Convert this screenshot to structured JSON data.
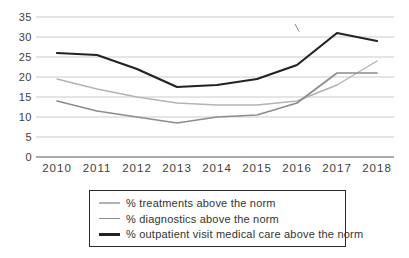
{
  "chart_data": {
    "type": "line",
    "title": "",
    "xlabel": "",
    "ylabel": "",
    "categories": [
      "2010",
      "2011",
      "2012",
      "2013",
      "2014",
      "2015",
      "2016",
      "2017",
      "2018"
    ],
    "y_ticks": [
      35,
      30,
      25,
      20,
      15,
      10,
      5,
      0
    ],
    "ylim": [
      0,
      35
    ],
    "grid": true,
    "legend_position": "bottom-box",
    "series": [
      {
        "id": "treatments",
        "name": "% treatments above the norm",
        "color": "#b3b3b3",
        "stroke_width": 1.4,
        "values": [
          19.5,
          17,
          15,
          13.5,
          13,
          13,
          14,
          18,
          24
        ]
      },
      {
        "id": "diagnostics",
        "name": "% diagnostics above the norm",
        "color": "#8c8c8c",
        "stroke_width": 1.7,
        "values": [
          14,
          11.5,
          10,
          8.5,
          10,
          10.5,
          13.5,
          21,
          21
        ]
      },
      {
        "id": "outpatient",
        "name": "% outpatient visit medical care above the norm",
        "color": "#222222",
        "stroke_width": 2.2,
        "values": [
          26,
          25.5,
          22,
          17.5,
          18,
          19.5,
          23,
          31,
          29
        ]
      }
    ]
  },
  "colors": {
    "background": "#ffffff",
    "gridline": "#cbcbcb",
    "axis_zero_line": "#8f8f8f",
    "tick_label": "#3d3d3d",
    "legend_border": "#2b2b2b",
    "legend_text": "#333333"
  }
}
